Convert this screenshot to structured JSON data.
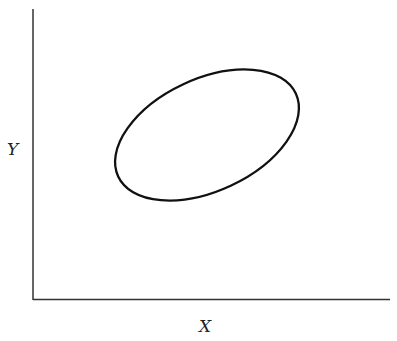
{
  "diagram": {
    "x_axis_label": "X",
    "y_axis_label": "Y",
    "shape": "ellipse",
    "ellipse": {
      "cx": 207,
      "cy": 135,
      "rx": 98,
      "ry": 56,
      "rotation_deg": -25
    },
    "colors": {
      "stroke": "#111111",
      "axis": "#333333",
      "background": "#ffffff"
    }
  }
}
